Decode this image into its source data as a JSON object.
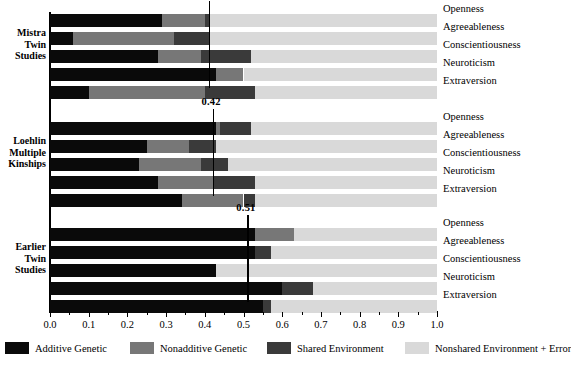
{
  "chart_data": {
    "type": "bar",
    "orientation": "horizontal",
    "stacked": true,
    "title": "",
    "xlabel": "",
    "ylabel": "",
    "xlim": [
      0.0,
      1.0
    ],
    "grid": false,
    "legend_position": "bottom",
    "xticks": [
      "0.0",
      "0.1",
      "0.2",
      "0.3",
      "0.4",
      "0.5",
      "0.6",
      "0.7",
      "0.8",
      "0.9",
      "1.0"
    ],
    "xtick_values": [
      0.0,
      0.1,
      0.2,
      0.3,
      0.4,
      0.5,
      0.6,
      0.7,
      0.8,
      0.9,
      1.0
    ],
    "legend": [
      {
        "name": "Additive Genetic",
        "color": "#0a0a0a"
      },
      {
        "name": "Nonadditive Genetic",
        "color": "#777777"
      },
      {
        "name": "Shared Environment",
        "color": "#3a3a3a"
      },
      {
        "name": "Nonshared Environment + Error",
        "color": "#d9d9d9"
      }
    ],
    "series_order": [
      "Additive Genetic",
      "Nonadditive Genetic",
      "Shared Environment",
      "Nonshared Environment + Error"
    ],
    "categories": [
      "Openness",
      "Agreeableness",
      "Conscientiousness",
      "Neuroticism",
      "Extraversion"
    ],
    "groups": [
      {
        "name": "Mistra Twin Studies",
        "name_lines": [
          "Mistra",
          "Twin",
          "Studies"
        ],
        "mean_label": "0.41",
        "mean_value": 0.41,
        "rows": [
          {
            "trait": "Openness",
            "additive": 0.29,
            "nonadditive": 0.11,
            "shared": 0.01,
            "nonshared": 0.59
          },
          {
            "trait": "Agreeableness",
            "additive": 0.06,
            "nonadditive": 0.26,
            "shared": 0.09,
            "nonshared": 0.59
          },
          {
            "trait": "Conscientiousness",
            "additive": 0.28,
            "nonadditive": 0.11,
            "shared": 0.13,
            "nonshared": 0.48
          },
          {
            "trait": "Neuroticism",
            "additive": 0.43,
            "nonadditive": 0.07,
            "shared": 0.0,
            "nonshared": 0.5
          },
          {
            "trait": "Extraversion",
            "additive": 0.1,
            "nonadditive": 0.3,
            "shared": 0.13,
            "nonshared": 0.47
          }
        ]
      },
      {
        "name": "Loehlin Multiple Kinships",
        "name_lines": [
          "Loehlin",
          "Multiple",
          "Kinships"
        ],
        "mean_label": "0.42",
        "mean_value": 0.42,
        "rows": [
          {
            "trait": "Openness",
            "additive": 0.43,
            "nonadditive": 0.01,
            "shared": 0.08,
            "nonshared": 0.48
          },
          {
            "trait": "Agreeableness",
            "additive": 0.25,
            "nonadditive": 0.11,
            "shared": 0.07,
            "nonshared": 0.57
          },
          {
            "trait": "Conscientiousness",
            "additive": 0.23,
            "nonadditive": 0.16,
            "shared": 0.07,
            "nonshared": 0.54
          },
          {
            "trait": "Neuroticism",
            "additive": 0.28,
            "nonadditive": 0.14,
            "shared": 0.11,
            "nonshared": 0.47
          },
          {
            "trait": "Extraversion",
            "additive": 0.34,
            "nonadditive": 0.16,
            "shared": 0.03,
            "nonshared": 0.47
          }
        ]
      },
      {
        "name": "Earlier Twin Studies",
        "name_lines": [
          "Earlier",
          "Twin",
          "Studies"
        ],
        "mean_label": "0.51",
        "mean_value": 0.51,
        "rows": [
          {
            "trait": "Openness",
            "additive": 0.53,
            "nonadditive": 0.1,
            "shared": 0.0,
            "nonshared": 0.37
          },
          {
            "trait": "Agreeableness",
            "additive": 0.53,
            "nonadditive": 0.0,
            "shared": 0.04,
            "nonshared": 0.43
          },
          {
            "trait": "Conscientiousness",
            "additive": 0.43,
            "nonadditive": 0.0,
            "shared": 0.0,
            "nonshared": 0.57
          },
          {
            "trait": "Neuroticism",
            "additive": 0.6,
            "nonadditive": 0.0,
            "shared": 0.08,
            "nonshared": 0.32
          },
          {
            "trait": "Extraversion",
            "additive": 0.55,
            "nonadditive": 0.0,
            "shared": 0.02,
            "nonshared": 0.43
          }
        ]
      }
    ]
  }
}
